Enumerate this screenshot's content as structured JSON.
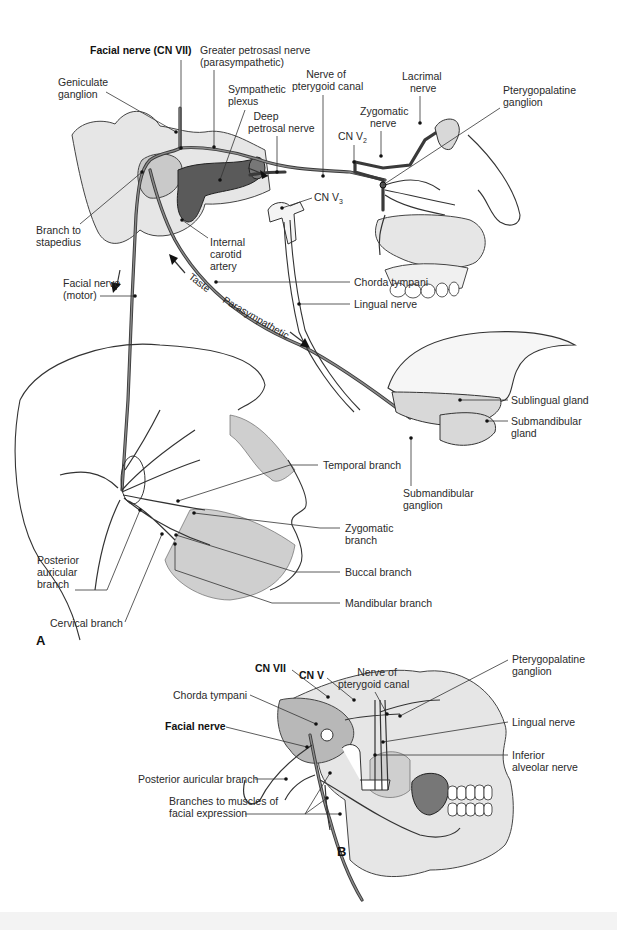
{
  "figure": {
    "panel_a_label": "A",
    "panel_b_label": "B",
    "panel_a": {
      "labels": {
        "facial_nerve_cn_vii": "Facial nerve (CN VII)",
        "greater_petrosal_line1": "Greater petrosasl nerve",
        "greater_petrosal_line2": "(parasympathetic)",
        "geniculate_line1": "Geniculate",
        "geniculate_line2": "ganglion",
        "sympathetic_line1": "Sympathetic",
        "sympathetic_line2": "plexus",
        "deep_petrosal_line1": "Deep",
        "deep_petrosal_line2": "petrosal nerve",
        "pterygoid_canal_line1": "Nerve of",
        "pterygoid_canal_line2": "pterygoid canal",
        "lacrimal_line1": "Lacrimal",
        "lacrimal_line2": "nerve",
        "zygomatic_nerve_line1": "Zygomatic",
        "zygomatic_nerve_line2": "nerve",
        "cn_v2": "CN V",
        "cn_v2_sub": "2",
        "pterygopalatine_line1": "Pterygopalatine",
        "pterygopalatine_line2": "ganglion",
        "cn_v3": "CN V",
        "cn_v3_sub": "3",
        "branch_stapedius_line1": "Branch to",
        "branch_stapedius_line2": "stapedius",
        "internal_carotid_line1": "Internal",
        "internal_carotid_line2": "carotid",
        "internal_carotid_line3": "artery",
        "facial_motor_line1": "Facial nerve",
        "facial_motor_line2": "(motor)",
        "chorda_tympani": "Chorda tympani",
        "lingual_nerve": "Lingual nerve",
        "taste": "Taste",
        "parasympathetic": "Parasympathetic",
        "sublingual_gland": "Sublingual gland",
        "submandibular_gland_line1": "Submandibular",
        "submandibular_gland_line2": "gland",
        "submandibular_ganglion_line1": "Submandibular",
        "submandibular_ganglion_line2": "ganglion",
        "temporal_branch": "Temporal branch",
        "zygomatic_branch_line1": "Zygomatic",
        "zygomatic_branch_line2": "branch",
        "buccal_branch": "Buccal branch",
        "mandibular_branch": "Mandibular branch",
        "posterior_auricular_line1": "Posterior",
        "posterior_auricular_line2": "auricular",
        "posterior_auricular_line3": "branch",
        "cervical_branch": "Cervical branch"
      }
    },
    "panel_b": {
      "labels": {
        "pterygoid_canal_line1": "Nerve of",
        "pterygoid_canal_line2": "pterygoid canal",
        "cn_v": "CN V",
        "cn_vii": "CN VII",
        "chorda_tympani": "Chorda tympani",
        "facial_nerve": "Facial nerve",
        "posterior_auricular_branch": "Posterior auricular branch",
        "branches_muscles_line1": "Branches to muscles of",
        "branches_muscles_line2": "facial expression",
        "pterygopalatine_line1": "Pterygopalatine",
        "pterygopalatine_line2": "ganglion",
        "lingual_nerve": "Lingual nerve",
        "inferior_alveolar_line1": "Inferior",
        "inferior_alveolar_line2": "alveolar nerve"
      }
    }
  }
}
